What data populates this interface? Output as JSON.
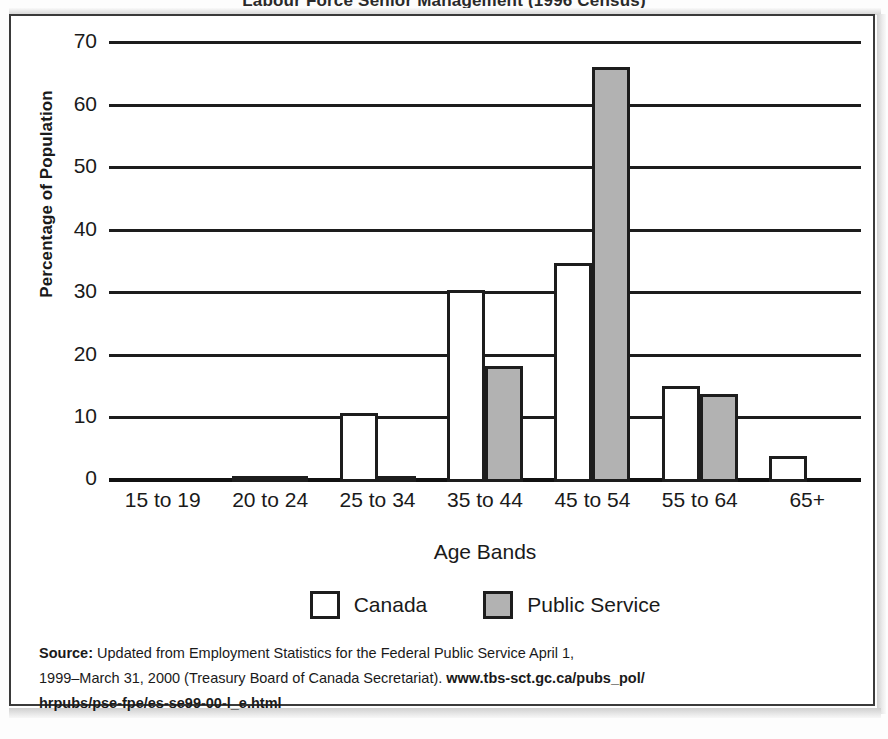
{
  "title": "Labour Force Senior Management (1996 Census)",
  "axes": {
    "ylabel": "Percentage of Population",
    "xlabel": "Age Bands"
  },
  "legend": {
    "items": [
      {
        "label": "Canada",
        "color": "#ffffff"
      },
      {
        "label": "Public Service",
        "color": "#b2b2b2"
      }
    ]
  },
  "source": {
    "label": "Source:",
    "line1": " Updated from Employment Statistics for the Federal Public Service April 1,",
    "line2": "1999–March 31, 2000 (Treasury Board of Canada Secretariat). ",
    "url1": "www.tbs-sct.gc.ca/pubs_pol/",
    "url2": "hrpubs/pse-fpe/es-se99-00-l_e.html"
  },
  "chart_data": {
    "type": "bar",
    "title": "Labour Force Senior Management (1996 Census)",
    "xlabel": "Age Bands",
    "ylabel": "Percentage of Population",
    "categories": [
      "15 to 19",
      "20 to 24",
      "25 to 34",
      "35 to 44",
      "45 to 54",
      "55 to 64",
      "65+"
    ],
    "series": [
      {
        "name": "Canada",
        "color": "#ffffff",
        "values": [
          0,
          0.8,
          11.0,
          30.7,
          35.0,
          15.3,
          4.2
        ]
      },
      {
        "name": "Public Service",
        "color": "#b2b2b2",
        "values": [
          0,
          0.2,
          0.3,
          18.5,
          66.3,
          14.0,
          0
        ]
      }
    ],
    "ylim": [
      0,
      70
    ],
    "yticks": [
      0,
      10,
      20,
      30,
      40,
      50,
      60,
      70
    ],
    "grid": "horizontal",
    "legend_position": "bottom"
  }
}
